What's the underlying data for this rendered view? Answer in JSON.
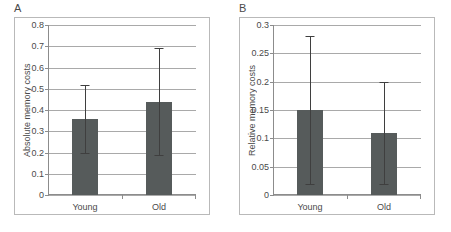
{
  "figure": {
    "background": "#ffffff",
    "bar_color": "#565b5b",
    "grid_color": "#a9a9a9",
    "axis_color": "#8c8c8c",
    "error_color": "#3f3f3f"
  },
  "panels": [
    {
      "letter": "A",
      "chart_data": {
        "type": "bar",
        "title": "",
        "xlabel": "",
        "ylabel": "Absolute memory costs",
        "categories": [
          "Young",
          "Old"
        ],
        "values": [
          0.36,
          0.44
        ],
        "errors_low": [
          0.2,
          0.19
        ],
        "errors_high": [
          0.52,
          0.69
        ],
        "ylim": [
          0,
          0.8
        ],
        "yticks": [
          0,
          0.1,
          0.2,
          0.3,
          0.4,
          0.5,
          0.6,
          0.7,
          0.8
        ],
        "ytick_labels": [
          "0",
          "0.1",
          "0.2",
          "0.3",
          "0.4",
          "0.5",
          "0.6",
          "0.7",
          "0.8"
        ],
        "grid": true,
        "legend": "none"
      }
    },
    {
      "letter": "B",
      "chart_data": {
        "type": "bar",
        "title": "",
        "xlabel": "",
        "ylabel": "Relative memory costs",
        "categories": [
          "Young",
          "Old"
        ],
        "values": [
          0.15,
          0.11
        ],
        "errors_low": [
          0.02,
          0.02
        ],
        "errors_high": [
          0.28,
          0.2
        ],
        "ylim": [
          0,
          0.3
        ],
        "yticks": [
          0,
          0.05,
          0.1,
          0.15,
          0.2,
          0.25,
          0.3
        ],
        "ytick_labels": [
          "0",
          "0.05",
          "0.1",
          "0.15",
          "0.2",
          "0.25",
          "0.3"
        ],
        "grid": true,
        "legend": "none"
      }
    }
  ]
}
